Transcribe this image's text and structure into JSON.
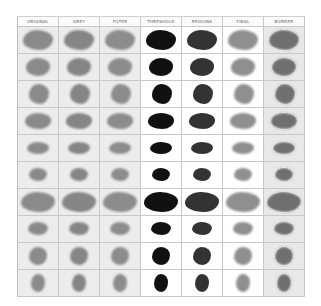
{
  "columns": [
    "ORIGINAL",
    "GREY",
    "FILTER",
    "THRESHOLD",
    "REGIONS",
    "FINAL",
    "BORDER"
  ],
  "colors": {
    "original": "#8a8a8a",
    "grey": "#858585",
    "filter": "#8c8c8c",
    "threshold": "#111111",
    "regions": "#333333",
    "final": "#8f8f8f",
    "border": "#6f6f6f"
  },
  "rows": [
    {
      "w": 30,
      "h": 20,
      "x": 5,
      "y": 3
    },
    {
      "w": 24,
      "h": 18,
      "x": 8,
      "y": 4
    },
    {
      "w": 20,
      "h": 20,
      "x": 11,
      "y": 3
    },
    {
      "w": 26,
      "h": 16,
      "x": 7,
      "y": 5
    },
    {
      "w": 22,
      "h": 12,
      "x": 9,
      "y": 7
    },
    {
      "w": 18,
      "h": 13,
      "x": 11,
      "y": 6
    },
    {
      "w": 34,
      "h": 20,
      "x": 3,
      "y": 3
    },
    {
      "w": 20,
      "h": 13,
      "x": 10,
      "y": 6
    },
    {
      "w": 18,
      "h": 18,
      "x": 11,
      "y": 4
    },
    {
      "w": 14,
      "h": 18,
      "x": 13,
      "y": 4
    }
  ]
}
